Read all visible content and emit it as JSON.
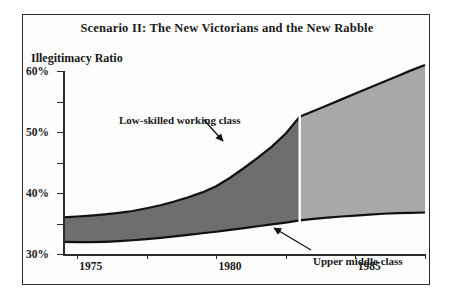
{
  "figure": {
    "title": "Scenario II: The New Victorians and the New Rabble",
    "ylabel": "Illegitimacy Ratio"
  },
  "annotations": {
    "low_skilled": "Low-skilled working class",
    "upper_middle": "Upper middle class"
  },
  "colors": {
    "historical_band": "#6e6e6e",
    "projected_band": "#a8a8a8",
    "line": "#111111",
    "frame": "#2b2b2b",
    "divider": "#ffffff"
  },
  "chart_data": {
    "type": "area",
    "title": "Scenario II: The New Victorians and the New Rabble",
    "xlabel": "",
    "ylabel": "Illegitimacy Ratio",
    "xlim": [
      1974,
      2000
    ],
    "ylim": [
      0,
      60
    ],
    "xticks": [
      1975,
      1980,
      1985,
      1990,
      1995,
      2000
    ],
    "xtick_labels": [
      "1975",
      "1980",
      "1985",
      "1990",
      "1995",
      "2000"
    ],
    "yticks": [
      0,
      10,
      20,
      30,
      40,
      50,
      60
    ],
    "ytick_labels": [
      "0%",
      "10%",
      "20%",
      "30%",
      "40%",
      "50%",
      "60%"
    ],
    "grid": false,
    "legend": "annotations-inline",
    "divider_year": 1991,
    "divider_note": "white vertical line separating historical (dark) from projected (light) shading",
    "x": [
      1974,
      1975,
      1976,
      1977,
      1978,
      1979,
      1980,
      1981,
      1982,
      1983,
      1984,
      1985,
      1986,
      1987,
      1988,
      1989,
      1990,
      1991,
      1992,
      1993,
      1994,
      1995,
      1996,
      1997,
      1998,
      1999,
      2000
    ],
    "series": [
      {
        "name": "Low-skilled working class",
        "role": "upper-boundary",
        "values": [
          12.0,
          12.3,
          12.6,
          13.0,
          13.5,
          14.1,
          15.0,
          16.0,
          17.2,
          18.6,
          20.2,
          22.2,
          25.0,
          28.2,
          31.6,
          35.2,
          39.5,
          45.0,
          46.9,
          48.8,
          50.7,
          52.6,
          54.5,
          56.4,
          58.3,
          60.2,
          62.0
        ]
      },
      {
        "name": "Upper middle class",
        "role": "lower-boundary",
        "values": [
          4.0,
          3.9,
          3.9,
          4.0,
          4.2,
          4.5,
          4.9,
          5.3,
          5.8,
          6.3,
          6.8,
          7.3,
          7.9,
          8.5,
          9.1,
          9.7,
          10.3,
          11.0,
          11.5,
          11.9,
          12.3,
          12.6,
          12.9,
          13.2,
          13.4,
          13.5,
          13.6
        ]
      }
    ]
  }
}
